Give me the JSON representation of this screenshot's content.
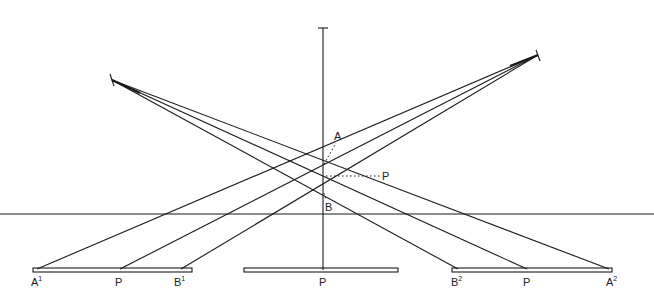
{
  "diagram": {
    "colors": {
      "line": "#1a1a1a",
      "background": "#ffffff"
    },
    "labels": {
      "A": "A",
      "B": "B",
      "P_point": "P",
      "A1": "A",
      "A1_sup": "1",
      "P_left": "P",
      "B1": "B",
      "B1_sup": "1",
      "P_center": "P",
      "B2": "B",
      "B2_sup": "2",
      "P_right": "P",
      "A2": "A",
      "A2_sup": "2"
    },
    "elements": {
      "left_viewpoint": {
        "x": 112,
        "y": 80
      },
      "right_viewpoint": {
        "x": 538,
        "y": 55
      },
      "vertical_axis": {
        "x": 323,
        "y_top": 28,
        "y_bottom": 270
      },
      "horizontal_line_y": 214,
      "screens": [
        {
          "name": "left-screen",
          "x1": 33,
          "x2": 192
        },
        {
          "name": "center-screen",
          "x1": 244,
          "x2": 398
        },
        {
          "name": "right-screen",
          "x1": 452,
          "x2": 612
        }
      ]
    }
  }
}
